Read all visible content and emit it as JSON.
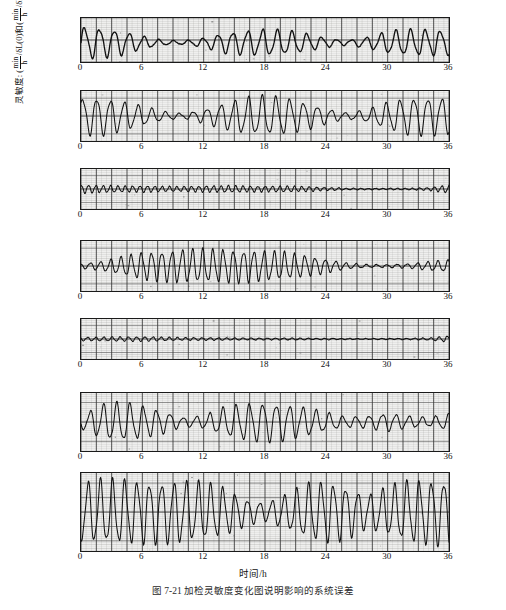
{
  "figure": {
    "caption": "图 7-21  加检灵敏度变化图说明影响的系统误差",
    "xaxis_title": "时间/h",
    "yaxis_title_prefix": "灵敏度:",
    "yaxis_title_parts": {
      "unit_num": "min",
      "unit_den": "h",
      "mid": "/δL(0)和",
      "unit2_num": "min",
      "unit2_den": "h",
      "tail": "/δL̇(0)"
    }
  },
  "chart_data": {
    "type": "line",
    "title": "加检灵敏度变化图说明影响的系统误差",
    "xlabel": "时间/h",
    "ylabel": "灵敏度: (min/h)/δL(0) 和 (min/h)/δL̇(0)",
    "xlim": [
      0,
      36
    ],
    "xticks": [
      0,
      6,
      12,
      18,
      24,
      30,
      36
    ],
    "xticklabels": [
      "0",
      "6",
      "12",
      "18",
      "24",
      "30",
      "36"
    ],
    "grid": true,
    "legend": "none",
    "panels": [
      {
        "index": 1,
        "label": "δL",
        "label_plain": "delta-L",
        "ylim": [
          -0.5,
          0.5
        ],
        "yticks": [
          0.5,
          0,
          -0.5
        ],
        "yticklabels": [
          "0.50",
          "0",
          "-0.50"
        ],
        "description": "Damped beating oscillation, amplitude ~0.35 near t=0, decaying to near zero around t=8-11, re-growing in bursts near t=13-22 and t=28-36",
        "envelope_points": [
          {
            "t": 0,
            "amp": 0.34
          },
          {
            "t": 2,
            "amp": 0.32
          },
          {
            "t": 4,
            "amp": 0.26
          },
          {
            "t": 6,
            "amp": 0.14
          },
          {
            "t": 8,
            "amp": 0.05
          },
          {
            "t": 10,
            "amp": 0.04
          },
          {
            "t": 12,
            "amp": 0.1
          },
          {
            "t": 14,
            "amp": 0.22
          },
          {
            "t": 16,
            "amp": 0.26
          },
          {
            "t": 18,
            "amp": 0.28
          },
          {
            "t": 20,
            "amp": 0.26
          },
          {
            "t": 22,
            "amp": 0.2
          },
          {
            "t": 24,
            "amp": 0.1
          },
          {
            "t": 26,
            "amp": 0.05
          },
          {
            "t": 28,
            "amp": 0.12
          },
          {
            "t": 30,
            "amp": 0.24
          },
          {
            "t": 32,
            "amp": 0.28
          },
          {
            "t": 34,
            "amp": 0.28
          },
          {
            "t": 36,
            "amp": 0.26
          }
        ],
        "period_h": 1.45,
        "offset": -0.06
      },
      {
        "index": 2,
        "label": "εE",
        "label_plain": "epsilon-E",
        "ylim": [
          -0.35,
          0.35
        ],
        "yticks": [
          0.25,
          0,
          -0.25
        ],
        "yticklabels": [
          "0.25",
          "0",
          "-0.25"
        ],
        "description": "Beating oscillation with nodes near t=9-11 and t=26-28, strong bursts at t=0-6, t=15-23 and t=30-36",
        "envelope_points": [
          {
            "t": 0,
            "amp": 0.24
          },
          {
            "t": 2,
            "amp": 0.25
          },
          {
            "t": 4,
            "amp": 0.2
          },
          {
            "t": 6,
            "amp": 0.13
          },
          {
            "t": 8,
            "amp": 0.06
          },
          {
            "t": 10,
            "amp": 0.03
          },
          {
            "t": 12,
            "amp": 0.09
          },
          {
            "t": 14,
            "amp": 0.17
          },
          {
            "t": 16,
            "amp": 0.24
          },
          {
            "t": 18,
            "amp": 0.26
          },
          {
            "t": 20,
            "amp": 0.24
          },
          {
            "t": 22,
            "amp": 0.18
          },
          {
            "t": 24,
            "amp": 0.1
          },
          {
            "t": 26,
            "amp": 0.04
          },
          {
            "t": 28,
            "amp": 0.08
          },
          {
            "t": 30,
            "amp": 0.18
          },
          {
            "t": 32,
            "amp": 0.24
          },
          {
            "t": 34,
            "amp": 0.25
          },
          {
            "t": 36,
            "amp": 0.24
          }
        ],
        "period_h": 1.35,
        "offset": 0.0
      },
      {
        "index": 3,
        "label": "δl",
        "label_plain": "delta-l",
        "ylim": [
          -1.5,
          1.5
        ],
        "yticks": [
          1,
          0,
          -1
        ],
        "yticklabels": [
          "1",
          "0",
          "-1"
        ],
        "description": "Low amplitude fast ripple throughout, amplitude ~0.2, nearly flat after t=26, small spike near t=36",
        "envelope_points": [
          {
            "t": 0,
            "amp": 0.3
          },
          {
            "t": 2,
            "amp": 0.26
          },
          {
            "t": 4,
            "amp": 0.22
          },
          {
            "t": 6,
            "amp": 0.24
          },
          {
            "t": 8,
            "amp": 0.2
          },
          {
            "t": 10,
            "amp": 0.18
          },
          {
            "t": 12,
            "amp": 0.22
          },
          {
            "t": 14,
            "amp": 0.24
          },
          {
            "t": 16,
            "amp": 0.22
          },
          {
            "t": 18,
            "amp": 0.2
          },
          {
            "t": 20,
            "amp": 0.22
          },
          {
            "t": 22,
            "amp": 0.18
          },
          {
            "t": 24,
            "amp": 0.12
          },
          {
            "t": 26,
            "amp": 0.06
          },
          {
            "t": 28,
            "amp": 0.05
          },
          {
            "t": 30,
            "amp": 0.05
          },
          {
            "t": 32,
            "amp": 0.06
          },
          {
            "t": 34,
            "amp": 0.1
          },
          {
            "t": 36,
            "amp": 0.3
          }
        ],
        "period_h": 0.72,
        "offset": 0.0
      },
      {
        "index": 4,
        "label": "εN",
        "label_plain": "epsilon-N",
        "ylim": [
          -0.35,
          0.35
        ],
        "yticks": [
          0.25,
          0,
          -0.25
        ],
        "yticklabels": [
          "0.25",
          "0",
          "-0.25"
        ],
        "description": "Quiet at start, growing oscillation from t=4 to t=22, amplitude ~0.22, decaying to flat after t=26 with small tail at t=34",
        "envelope_points": [
          {
            "t": 0,
            "amp": 0.03
          },
          {
            "t": 2,
            "amp": 0.06
          },
          {
            "t": 4,
            "amp": 0.12
          },
          {
            "t": 6,
            "amp": 0.18
          },
          {
            "t": 8,
            "amp": 0.2
          },
          {
            "t": 10,
            "amp": 0.22
          },
          {
            "t": 12,
            "amp": 0.22
          },
          {
            "t": 14,
            "amp": 0.22
          },
          {
            "t": 16,
            "amp": 0.21
          },
          {
            "t": 18,
            "amp": 0.2
          },
          {
            "t": 20,
            "amp": 0.18
          },
          {
            "t": 22,
            "amp": 0.14
          },
          {
            "t": 24,
            "amp": 0.09
          },
          {
            "t": 26,
            "amp": 0.04
          },
          {
            "t": 28,
            "amp": 0.02
          },
          {
            "t": 30,
            "amp": 0.02
          },
          {
            "t": 32,
            "amp": 0.03
          },
          {
            "t": 34,
            "amp": 0.06
          },
          {
            "t": 36,
            "amp": 0.08
          }
        ],
        "period_h": 1.0,
        "offset": 0.0
      },
      {
        "index": 5,
        "label": "εD",
        "label_plain": "epsilon-D",
        "ylim": [
          -1.5,
          1.5
        ],
        "yticks": [
          1,
          0,
          -1
        ],
        "yticklabels": [
          "1",
          "0",
          "-1"
        ],
        "description": "Very low amplitude ripple near zero across whole record, slight rise near t=4-8, small step near t=35",
        "envelope_points": [
          {
            "t": 0,
            "amp": 0.12
          },
          {
            "t": 2,
            "amp": 0.14
          },
          {
            "t": 4,
            "amp": 0.16
          },
          {
            "t": 6,
            "amp": 0.16
          },
          {
            "t": 8,
            "amp": 0.14
          },
          {
            "t": 10,
            "amp": 0.1
          },
          {
            "t": 12,
            "amp": 0.09
          },
          {
            "t": 14,
            "amp": 0.09
          },
          {
            "t": 16,
            "amp": 0.08
          },
          {
            "t": 18,
            "amp": 0.07
          },
          {
            "t": 20,
            "amp": 0.07
          },
          {
            "t": 22,
            "amp": 0.06
          },
          {
            "t": 24,
            "amp": 0.05
          },
          {
            "t": 26,
            "amp": 0.04
          },
          {
            "t": 28,
            "amp": 0.04
          },
          {
            "t": 30,
            "amp": 0.04
          },
          {
            "t": 32,
            "amp": 0.05
          },
          {
            "t": 34,
            "amp": 0.08
          },
          {
            "t": 36,
            "amp": 0.22
          }
        ],
        "period_h": 0.8,
        "offset": 0.0
      },
      {
        "index": 6,
        "label": "δL̇",
        "label_plain": "delta-L-dot",
        "ylim": [
          -1.5,
          1.5
        ],
        "yticks": [
          1,
          0,
          -1
        ],
        "yticklabels": [
          "1",
          "0",
          "-1"
        ],
        "description": "Large beating oscillation amplitude ~0.9 at t=2-8 and t=14-22, node near t=10-12 and t=26-30, decaying tail after t=30",
        "envelope_points": [
          {
            "t": 0,
            "amp": 0.3
          },
          {
            "t": 2,
            "amp": 0.85
          },
          {
            "t": 4,
            "amp": 0.95
          },
          {
            "t": 6,
            "amp": 0.8
          },
          {
            "t": 8,
            "amp": 0.55
          },
          {
            "t": 10,
            "amp": 0.22
          },
          {
            "t": 12,
            "amp": 0.3
          },
          {
            "t": 14,
            "amp": 0.7
          },
          {
            "t": 16,
            "amp": 0.9
          },
          {
            "t": 18,
            "amp": 0.95
          },
          {
            "t": 20,
            "amp": 0.88
          },
          {
            "t": 22,
            "amp": 0.7
          },
          {
            "t": 24,
            "amp": 0.45
          },
          {
            "t": 26,
            "amp": 0.25
          },
          {
            "t": 28,
            "amp": 0.3
          },
          {
            "t": 30,
            "amp": 0.45
          },
          {
            "t": 32,
            "amp": 0.3
          },
          {
            "t": 34,
            "amp": 0.22
          },
          {
            "t": 36,
            "amp": 0.4
          }
        ],
        "period_h": 1.3,
        "offset": 0.0
      },
      {
        "index": 7,
        "label": "δL̇",
        "label_plain": "delta-L-dot-bottom",
        "ylim": [
          -1.35,
          1.35
        ],
        "yticks": [
          1.0,
          0.5,
          0,
          -0.5,
          -1.0
        ],
        "yticklabels": [
          "1.0",
          "0.5",
          "0",
          "-0.5",
          "-1.0"
        ],
        "description": "Continuous large amplitude oscillation near full scale, partial node near t=16-19 and t=27-30, amplitude ~1.0 elsewhere",
        "envelope_points": [
          {
            "t": 0,
            "amp": 0.95
          },
          {
            "t": 2,
            "amp": 1.05
          },
          {
            "t": 4,
            "amp": 1.05
          },
          {
            "t": 6,
            "amp": 1.0
          },
          {
            "t": 8,
            "amp": 1.0
          },
          {
            "t": 10,
            "amp": 1.0
          },
          {
            "t": 12,
            "amp": 0.95
          },
          {
            "t": 14,
            "amp": 0.8
          },
          {
            "t": 16,
            "amp": 0.45
          },
          {
            "t": 18,
            "amp": 0.3
          },
          {
            "t": 20,
            "amp": 0.55
          },
          {
            "t": 22,
            "amp": 0.9
          },
          {
            "t": 24,
            "amp": 1.0
          },
          {
            "t": 26,
            "amp": 0.85
          },
          {
            "t": 28,
            "amp": 0.55
          },
          {
            "t": 30,
            "amp": 0.8
          },
          {
            "t": 32,
            "amp": 1.0
          },
          {
            "t": 34,
            "amp": 1.05
          },
          {
            "t": 36,
            "amp": 1.05
          }
        ],
        "period_h": 1.2,
        "offset": 0.0
      }
    ]
  },
  "geometry": {
    "plot_left": 80,
    "plot_width": 368,
    "panels_top": [
      17,
      90,
      168,
      240,
      318,
      392,
      472
    ],
    "panels_height": [
      44,
      50,
      40,
      50,
      40,
      58,
      78
    ]
  }
}
